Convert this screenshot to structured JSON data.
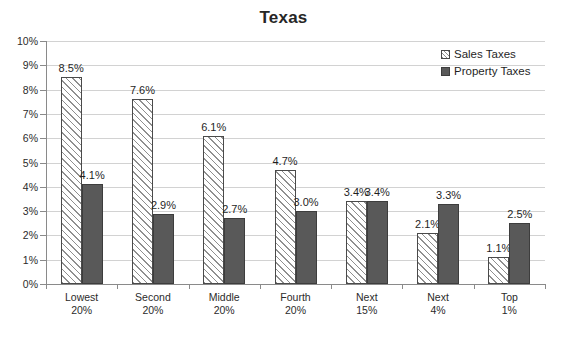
{
  "chart_data": {
    "type": "bar",
    "title": "Texas",
    "xlabel": "",
    "ylabel": "",
    "ylim": [
      0,
      10
    ],
    "ytick_labels": [
      "10%",
      "9%",
      "8%",
      "7%",
      "6%",
      "5%",
      "4%",
      "3%",
      "2%",
      "1%",
      "0%"
    ],
    "ytick_values": [
      10,
      9,
      8,
      7,
      6,
      5,
      4,
      3,
      2,
      1,
      0
    ],
    "grid": true,
    "legend_position": "top-right",
    "categories": [
      "Lowest 20%",
      "Second 20%",
      "Middle 20%",
      "Fourth 20%",
      "Next 15%",
      "Next 4%",
      "Top 1%"
    ],
    "category_lines": [
      [
        "Lowest",
        "20%"
      ],
      [
        "Second",
        "20%"
      ],
      [
        "Middle",
        "20%"
      ],
      [
        "Fourth",
        "20%"
      ],
      [
        "Next",
        "15%"
      ],
      [
        "Next",
        "4%"
      ],
      [
        "Top",
        "1%"
      ]
    ],
    "series": [
      {
        "name": "Sales Taxes",
        "values": [
          8.5,
          7.6,
          6.1,
          4.7,
          3.4,
          2.1,
          1.1
        ],
        "labels": [
          "8.5%",
          "7.6%",
          "6.1%",
          "4.7%",
          "3.4%",
          "2.1%",
          "1.1%"
        ],
        "fill": "hatched",
        "color": "#8f8f8f"
      },
      {
        "name": "Property Taxes",
        "values": [
          4.1,
          2.9,
          2.7,
          3.0,
          3.4,
          3.3,
          2.5
        ],
        "labels": [
          "4.1%",
          "2.9%",
          "2.7%",
          "3.0%",
          "3.4%",
          "3.3%",
          "2.5%"
        ],
        "fill": "solid",
        "color": "#595959"
      }
    ]
  },
  "legend": {
    "items": [
      {
        "label": "Sales Taxes",
        "swatch": "hatched-square-icon"
      },
      {
        "label": "Property Taxes",
        "swatch": "solid-square-icon"
      }
    ]
  }
}
